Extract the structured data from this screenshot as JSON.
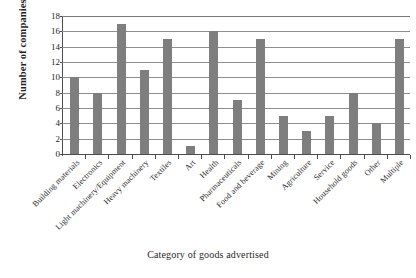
{
  "chart_data": {
    "type": "bar",
    "title": "",
    "xlabel": "Category of goods advertised",
    "ylabel": "Number of companies",
    "categories": [
      "Building materials",
      "Electronics",
      "Light machinery/Equipment",
      "Heavy machinery",
      "Textiles",
      "Art",
      "Health",
      "Pharmaceuticals",
      "Food and beverage",
      "Mining",
      "Agriculture",
      "Service",
      "Household goods",
      "Other",
      "Multiple"
    ],
    "values": [
      10,
      8,
      17,
      11,
      15,
      1,
      16,
      7,
      15,
      5,
      3,
      5,
      8,
      4,
      15
    ],
    "ylim": [
      0,
      18
    ],
    "ytick_labels": [
      "0",
      "2",
      "4",
      "6",
      "8",
      "10",
      "12",
      "14",
      "16",
      "18"
    ],
    "ytick_values": [
      0,
      2,
      4,
      6,
      8,
      10,
      12,
      14,
      16,
      18
    ],
    "grid": "horizontal",
    "legend": "none",
    "bar_color": "#7e7e7e",
    "axis_color": "#4d4d4d",
    "gridline_color": "#8e8e8e"
  }
}
